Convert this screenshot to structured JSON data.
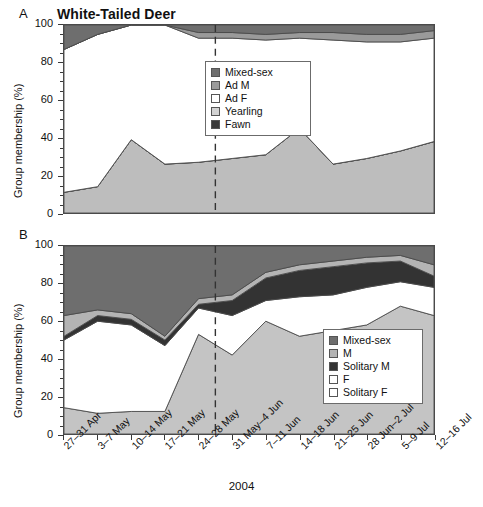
{
  "figure": {
    "title": "White-Tailed Deer",
    "x_axis_caption": "2004",
    "panel_a_letter": "A",
    "panel_b_letter": "B",
    "y_axis_title": "Group membership (%)"
  },
  "axis": {
    "y_ticks": [
      0,
      20,
      40,
      60,
      80,
      100
    ],
    "y_min": 0,
    "y_max": 100,
    "x_categories": [
      "27–31 Apr",
      "3–7 May",
      "10–14 May",
      "17–21 May",
      "24–28 May",
      "31 May–4 Jun",
      "7–11 Jun",
      "14–18 Jun",
      "21–25 Jun",
      "28 Jun–2 Jul",
      "5–9 Jul",
      "12–16 Jul"
    ]
  },
  "colors": {
    "mixed_sex": "#6e6e6e",
    "ad_m": "#9a9a9a",
    "ad_f": "#ffffff",
    "yearling": "#bdbdbd",
    "fawn": "#3a3a3a",
    "m": "#b4b4b4",
    "solitary_m": "#333333",
    "f": "#ffffff",
    "solitary_f": "#c4c4c4",
    "frame": "#4a4a4a",
    "divider_line": "#333333"
  },
  "legend_a": {
    "items": [
      {
        "label": "Mixed-sex",
        "color": "#6e6e6e"
      },
      {
        "label": "Ad M",
        "color": "#9a9a9a"
      },
      {
        "label": "Ad F",
        "color": "#ffffff"
      },
      {
        "label": "Yearling",
        "color": "#d2d2d2"
      },
      {
        "label": "Fawn",
        "color": "#3a3a3a"
      }
    ]
  },
  "legend_b": {
    "items": [
      {
        "label": "Mixed-sex",
        "color": "#6e6e6e"
      },
      {
        "label": "M",
        "color": "#b4b4b4"
      },
      {
        "label": "Solitary M",
        "color": "#333333"
      },
      {
        "label": "F",
        "color": "#ffffff"
      },
      {
        "label": "Solitary F",
        "color": "#ffffff"
      }
    ]
  },
  "chart_data": [
    {
      "panel": "A",
      "type": "area",
      "title": "White-Tailed Deer",
      "xlabel": "2004",
      "ylabel": "Group membership (%)",
      "ylim": [
        0,
        100
      ],
      "grid": false,
      "legend_position": "inside-upper-right",
      "stack_order_bottom_to_top": [
        "Yearling",
        "Fawn",
        "Ad F",
        "Ad M",
        "Mixed-sex"
      ],
      "categories": [
        "27–31 Apr",
        "3–7 May",
        "10–14 May",
        "17–21 May",
        "24–28 May",
        "31 May–4 Jun",
        "7–11 Jun",
        "14–18 Jun",
        "21–25 Jun",
        "28 Jun–2 Jul",
        "5–9 Jul",
        "12–16 Jul"
      ],
      "series": [
        {
          "name": "Yearling",
          "values": [
            11,
            14,
            39,
            26,
            27,
            29,
            31,
            45,
            26,
            29,
            33,
            38
          ]
        },
        {
          "name": "Fawn",
          "values": [
            0,
            0,
            0,
            0,
            0,
            0,
            0,
            0,
            0,
            0,
            0,
            0
          ]
        },
        {
          "name": "Ad F",
          "values": [
            76,
            81,
            61,
            74,
            66,
            64,
            61,
            48,
            66,
            62,
            58,
            55
          ]
        },
        {
          "name": "Ad M",
          "values": [
            0,
            0,
            0,
            0,
            3,
            3,
            3,
            3,
            4,
            4,
            4,
            4
          ]
        },
        {
          "name": "Mixed-sex",
          "values": [
            13,
            5,
            0,
            0,
            4,
            4,
            5,
            4,
            4,
            5,
            5,
            3
          ]
        }
      ],
      "cumulative_top_of_lower_band": [
        11,
        14,
        39,
        26,
        27,
        29,
        31,
        45,
        26,
        29,
        33,
        38
      ],
      "cumulative_top_of_white_band": [
        87,
        95,
        100,
        100,
        93,
        93,
        92,
        93,
        92,
        91,
        91,
        93
      ],
      "divider_after_category_index": 4
    },
    {
      "panel": "B",
      "type": "area",
      "xlabel": "2004",
      "ylabel": "Group membership (%)",
      "ylim": [
        0,
        100
      ],
      "grid": false,
      "legend_position": "inside-lower-right",
      "stack_order_bottom_to_top": [
        "Solitary F",
        "F",
        "Solitary M",
        "M",
        "Mixed-sex"
      ],
      "categories": [
        "27–31 Apr",
        "3–7 May",
        "10–14 May",
        "17–21 May",
        "24–28 May",
        "31 May–4 Jun",
        "7–11 Jun",
        "14–18 Jun",
        "21–25 Jun",
        "28 Jun–2 Jul",
        "5–9 Jul",
        "12–16 Jul"
      ],
      "series": [
        {
          "name": "Solitary F",
          "values": [
            14,
            11,
            12,
            12,
            53,
            42,
            60,
            52,
            55,
            58,
            68,
            63
          ]
        },
        {
          "name": "F",
          "values": [
            36,
            49,
            46,
            35,
            14,
            21,
            11,
            21,
            19,
            20,
            13,
            15
          ]
        },
        {
          "name": "Solitary M",
          "values": [
            2,
            3,
            3,
            3,
            2,
            8,
            12,
            14,
            15,
            13,
            11,
            6
          ]
        },
        {
          "name": "M",
          "values": [
            11,
            3,
            3,
            2,
            3,
            3,
            3,
            3,
            3,
            3,
            3,
            6
          ]
        },
        {
          "name": "Mixed-sex",
          "values": [
            37,
            34,
            36,
            48,
            28,
            26,
            14,
            10,
            8,
            6,
            5,
            10
          ]
        }
      ],
      "cumulative_solitary_f": [
        14,
        11,
        12,
        12,
        53,
        42,
        60,
        52,
        55,
        58,
        68,
        63
      ],
      "cumulative_f": [
        50,
        60,
        58,
        47,
        67,
        63,
        71,
        73,
        74,
        78,
        81,
        78
      ],
      "cumulative_solitary_m": [
        52,
        63,
        61,
        50,
        69,
        71,
        83,
        87,
        89,
        91,
        92,
        84
      ],
      "cumulative_m": [
        63,
        66,
        64,
        52,
        72,
        74,
        86,
        90,
        92,
        94,
        95,
        90
      ],
      "divider_after_category_index": 4
    }
  ]
}
